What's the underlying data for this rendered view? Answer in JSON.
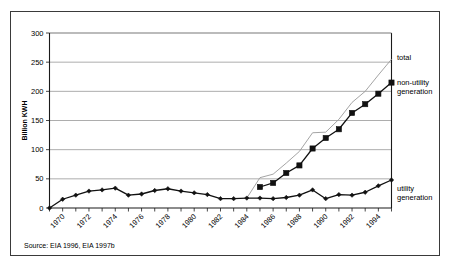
{
  "figure": {
    "source_note": "Source: EIA 1996, EIA 1997b"
  },
  "chart_data": {
    "type": "line",
    "title": "",
    "xlabel": "",
    "ylabel": "Billion KWH",
    "ylim": [
      0,
      300
    ],
    "xlim": [
      1969,
      1995
    ],
    "yticks": [
      0,
      50,
      100,
      150,
      200,
      250,
      300
    ],
    "ytick_labels": [
      "0",
      "50",
      "100",
      "150",
      "200",
      "250",
      "300"
    ],
    "xticks": [
      1970,
      1972,
      1974,
      1976,
      1978,
      1980,
      1982,
      1984,
      1986,
      1988,
      1990,
      1992,
      1994
    ],
    "xtick_labels": [
      "1970",
      "1972",
      "1974",
      "1976",
      "1978",
      "1980",
      "1982",
      "1984",
      "1986",
      "1988",
      "1990",
      "1992",
      "1994"
    ],
    "grid": true,
    "legend_position": "right-inline",
    "series": [
      {
        "name": "total",
        "label": "total",
        "color": "#9a9a9a",
        "marker": "none",
        "x": [
          1984,
          1985,
          1986,
          1987,
          1988,
          1989,
          1990,
          1991,
          1992,
          1993,
          1994,
          1995
        ],
        "values": [
          17,
          52,
          58,
          77,
          97,
          129,
          130,
          152,
          181,
          200,
          228,
          255
        ]
      },
      {
        "name": "non-utility generation",
        "label": "non-utility generation",
        "color": "#111111",
        "marker": "square",
        "x": [
          1985,
          1986,
          1987,
          1988,
          1989,
          1990,
          1991,
          1992,
          1993,
          1994,
          1995
        ],
        "values": [
          36,
          43,
          60,
          73,
          102,
          120,
          135,
          163,
          178,
          196,
          215
        ]
      },
      {
        "name": "utility generation",
        "label": "utility generation",
        "color": "#111111",
        "marker": "diamond",
        "x": [
          1969,
          1970,
          1971,
          1972,
          1973,
          1974,
          1975,
          1976,
          1977,
          1978,
          1979,
          1980,
          1981,
          1982,
          1983,
          1984,
          1985,
          1986,
          1987,
          1988,
          1989,
          1990,
          1991,
          1992,
          1993,
          1994,
          1995
        ],
        "values": [
          0,
          15,
          22,
          29,
          31,
          34,
          22,
          24,
          30,
          33,
          29,
          26,
          23,
          16,
          16,
          17,
          17,
          16,
          18,
          22,
          31,
          16,
          23,
          22,
          27,
          38,
          48
        ]
      }
    ]
  }
}
